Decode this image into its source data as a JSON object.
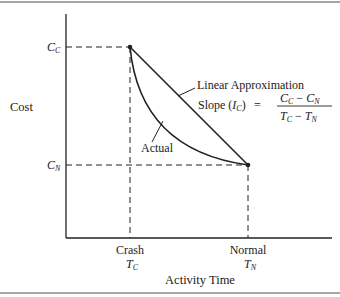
{
  "figure": {
    "y_axis_label": "Cost",
    "x_axis_label": "Activity Time",
    "y_ticks": [
      {
        "main": "C",
        "sub": "C",
        "meaning": "crash cost"
      },
      {
        "main": "C",
        "sub": "N",
        "meaning": "normal cost"
      }
    ],
    "x_ticks": [
      {
        "label": "Crash",
        "main": "T",
        "sub": "C"
      },
      {
        "label": "Normal",
        "main": "T",
        "sub": "N"
      }
    ],
    "curves": {
      "linear_label": "Linear Approximation",
      "actual_label": "Actual"
    },
    "formula": {
      "lhs": "Slope (",
      "lhs_var": "I",
      "lhs_sub": "C",
      "lhs_close": ")",
      "equals": "=",
      "numerator": {
        "a": "C",
        "a_sub": "C",
        "op": "−",
        "b": "C",
        "b_sub": "N"
      },
      "denominator": {
        "a": "T",
        "a_sub": "C",
        "op": "−",
        "b": "T",
        "b_sub": "N"
      }
    },
    "colors": {
      "line": "#222222",
      "rule": "#888888"
    }
  }
}
